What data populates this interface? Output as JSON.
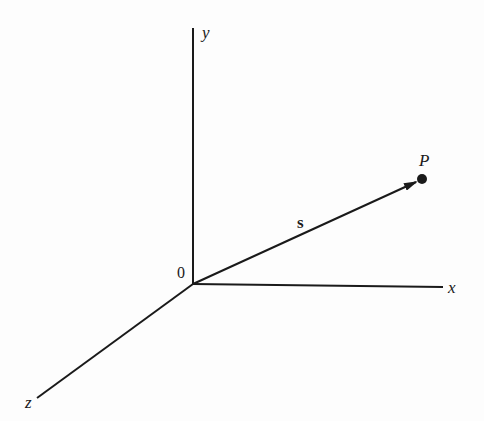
{
  "diagram": {
    "title": "",
    "origin_label": "0",
    "axes": {
      "x": {
        "label": "x"
      },
      "y": {
        "label": "y"
      },
      "z": {
        "label": "z"
      }
    },
    "vector": {
      "label": "s"
    },
    "point": {
      "label": "P"
    },
    "colors": {
      "ink": "#1a1a1a",
      "background": "#fdfdfd"
    }
  }
}
